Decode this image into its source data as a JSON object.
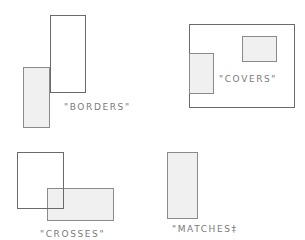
{
  "diagram": {
    "panels": [
      {
        "name": "borders",
        "label": "\"BORDERS\"",
        "shapes": [
          {
            "role": "filled",
            "x": 23,
            "y": 67,
            "w": 27,
            "h": 61
          },
          {
            "role": "outline",
            "x": 50,
            "y": 15,
            "w": 36,
            "h": 78
          }
        ],
        "label_pos": {
          "x": 64,
          "y": 103
        }
      },
      {
        "name": "covers",
        "label": "\"COVERS\"",
        "shapes": [
          {
            "role": "outline",
            "x": 189,
            "y": 24,
            "w": 106,
            "h": 84
          },
          {
            "role": "filled",
            "x": 189,
            "y": 53,
            "w": 25,
            "h": 41
          },
          {
            "role": "filled",
            "x": 242,
            "y": 36,
            "w": 35,
            "h": 26
          }
        ],
        "label_pos": {
          "x": 219,
          "y": 73
        }
      },
      {
        "name": "crosses",
        "label": "\"CROSSES\"",
        "shapes": [
          {
            "role": "outline",
            "x": 17,
            "y": 152,
            "w": 47,
            "h": 57
          },
          {
            "role": "filled",
            "x": 47,
            "y": 188,
            "w": 67,
            "h": 33
          }
        ],
        "label_pos": {
          "x": 40,
          "y": 230
        }
      },
      {
        "name": "matches",
        "label": "\"MATCHES‡",
        "shapes": [
          {
            "role": "filled",
            "x": 167,
            "y": 152,
            "w": 31,
            "h": 67
          }
        ],
        "label_pos": {
          "x": 172,
          "y": 224
        }
      }
    ],
    "colors": {
      "outline": "#6a6a6a",
      "fill": "#f0f0f0",
      "label": "#7a7a7a"
    }
  }
}
